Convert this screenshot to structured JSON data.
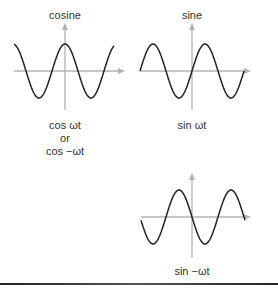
{
  "panels": [
    {
      "id": "cosine",
      "title": "cosine",
      "captions": [
        "cos ωt",
        "or",
        "cos −ωt"
      ],
      "function": "cos(wt)"
    },
    {
      "id": "sine",
      "title": "sine",
      "captions": [
        "sin ωt"
      ],
      "function": "sin(wt)"
    },
    {
      "id": "neg-sine",
      "title": "",
      "captions": [
        "sin −ωt"
      ],
      "function": "sin(-wt)"
    }
  ],
  "colors": {
    "axis": "#b3b3b3",
    "curve": "#222222",
    "text": "#333333"
  }
}
